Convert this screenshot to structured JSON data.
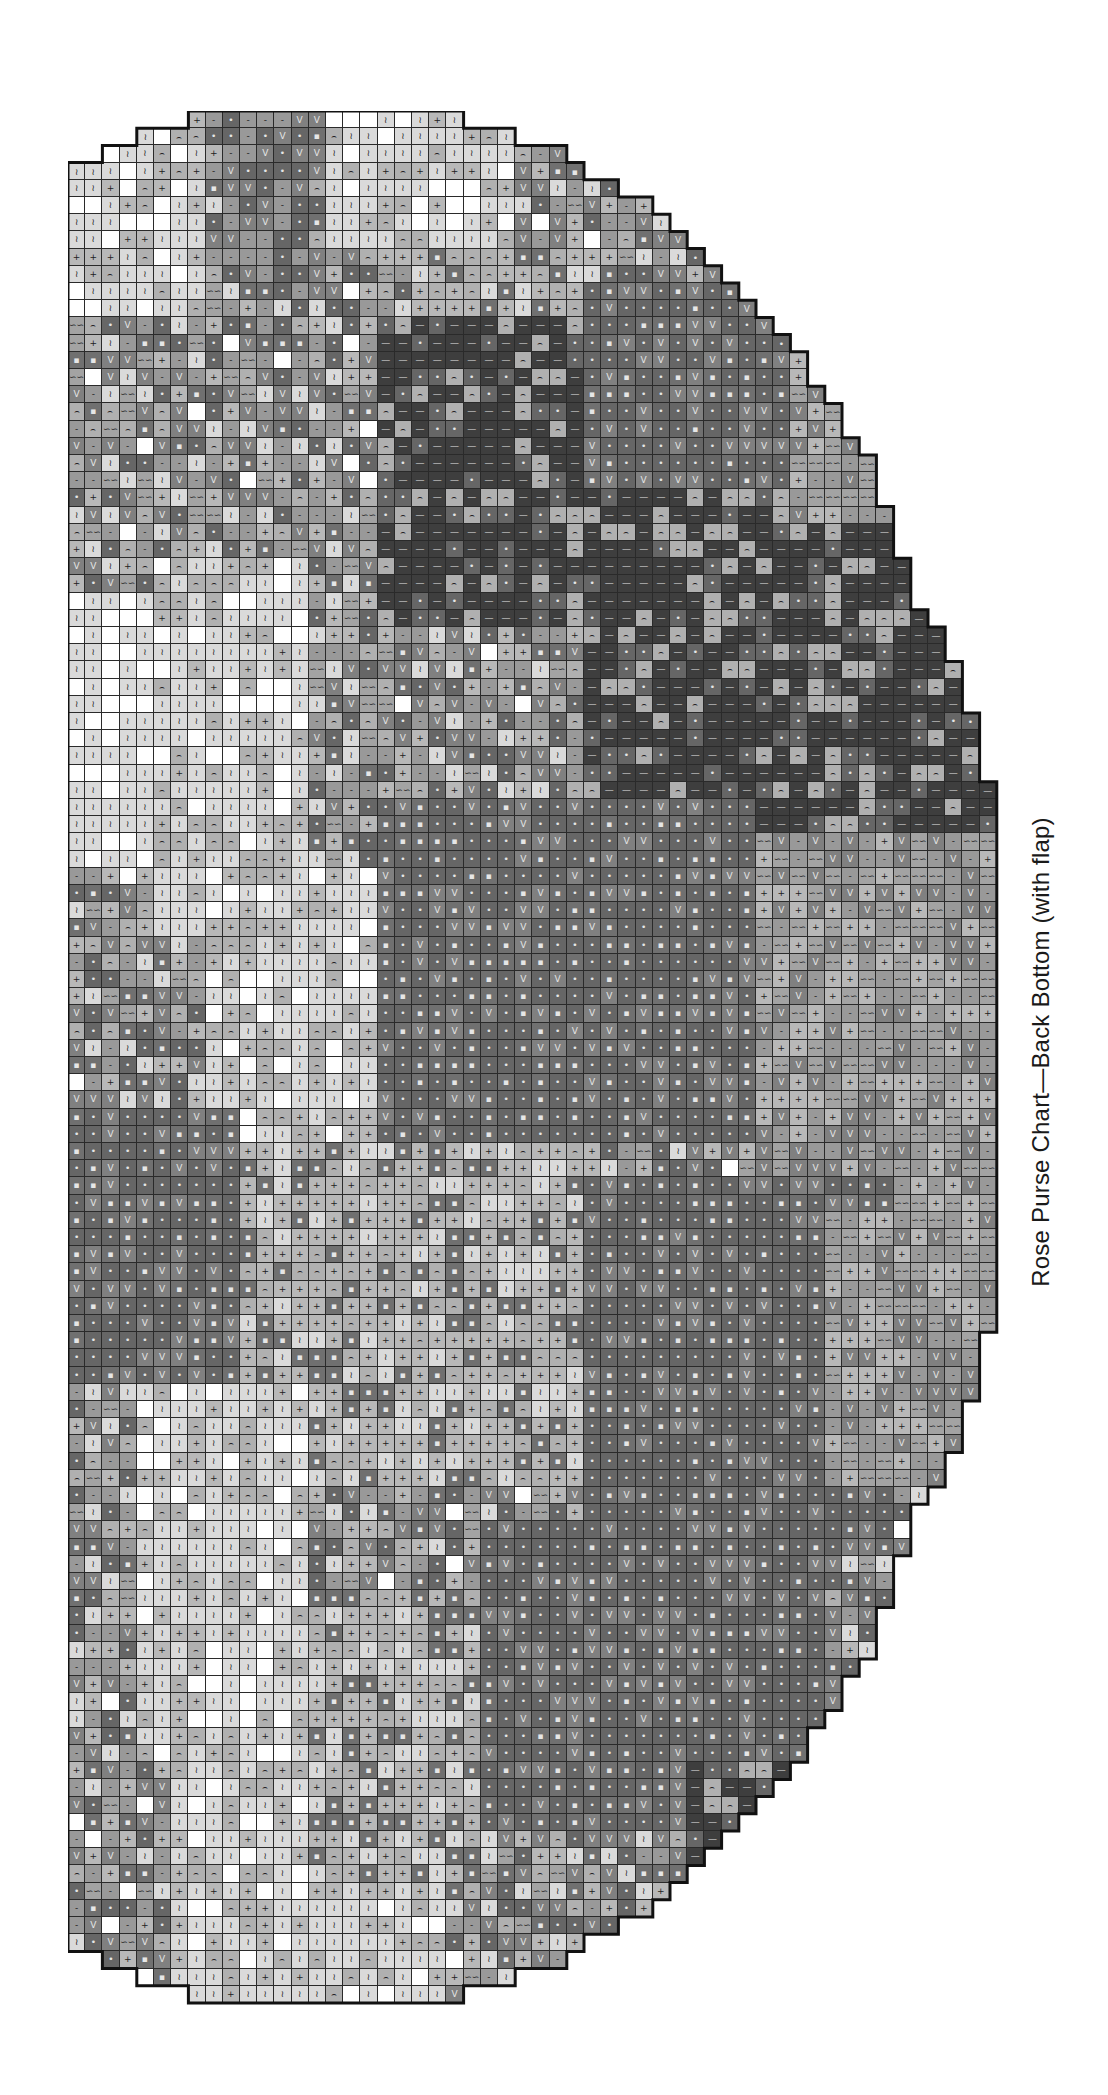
{
  "caption": "Rose Purse Chart—Back Bottom (with flap)",
  "chart_data": {
    "type": "heatmap",
    "title": "Rose Purse Chart—Back Bottom (with flap)",
    "grid": {
      "rows": 110,
      "cols": 55,
      "cell_px": 17.2,
      "left_px": 68,
      "top_px": 111
    },
    "legend": [
      {
        "key": "W",
        "symbol": "",
        "shade": "#ffffff",
        "name": "white"
      },
      {
        "key": "Z",
        "symbol": "≀",
        "shade": "#dadada",
        "name": "lightest"
      },
      {
        "key": "P",
        "symbol": "+",
        "shade": "#b8b8b8",
        "name": "light"
      },
      {
        "key": "A",
        "symbol": "⌢",
        "shade": "#b0b0b0",
        "name": "light-arc"
      },
      {
        "key": "S",
        "symbol": "∽∽",
        "shade": "#a3a3a3",
        "name": "medium-light"
      },
      {
        "key": "M",
        "symbol": "-",
        "shade": "#999999",
        "name": "medium"
      },
      {
        "key": "V",
        "symbol": "V",
        "shade": "#808080",
        "name": "medium-dark"
      },
      {
        "key": "D",
        "symbol": "•",
        "shade": "#666666",
        "name": "dark"
      },
      {
        "key": "Q",
        "symbol": "▪",
        "shade": "#707070",
        "name": "dark-square"
      },
      {
        "key": "L",
        "symbol": "—",
        "shade": "#3e3e3e",
        "name": "darkest"
      }
    ],
    "row_bounds_top_half": [
      [
        7,
        23
      ],
      [
        4,
        26
      ],
      [
        2,
        29
      ],
      [
        0,
        30
      ],
      [
        0,
        32
      ],
      [
        0,
        34
      ],
      [
        0,
        35
      ],
      [
        0,
        36
      ],
      [
        0,
        37
      ],
      [
        0,
        38
      ],
      [
        0,
        39
      ],
      [
        0,
        40
      ],
      [
        0,
        41
      ],
      [
        0,
        42
      ],
      [
        0,
        43
      ],
      [
        0,
        43
      ],
      [
        0,
        44
      ],
      [
        0,
        45
      ],
      [
        0,
        45
      ],
      [
        0,
        46
      ],
      [
        0,
        47
      ],
      [
        0,
        47
      ],
      [
        0,
        47
      ],
      [
        0,
        48
      ],
      [
        0,
        48
      ],
      [
        0,
        48
      ],
      [
        0,
        49
      ],
      [
        0,
        49
      ],
      [
        0,
        49
      ],
      [
        0,
        50
      ],
      [
        0,
        51
      ],
      [
        0,
        51
      ],
      [
        0,
        52
      ],
      [
        0,
        52
      ],
      [
        0,
        52
      ],
      [
        0,
        53
      ],
      [
        0,
        53
      ],
      [
        0,
        53
      ],
      [
        0,
        53
      ],
      [
        0,
        54
      ],
      [
        0,
        54
      ],
      [
        0,
        54
      ],
      [
        0,
        54
      ],
      [
        0,
        54
      ],
      [
        0,
        54
      ],
      [
        0,
        54
      ],
      [
        0,
        54
      ],
      [
        0,
        54
      ],
      [
        0,
        54
      ],
      [
        0,
        54
      ],
      [
        0,
        54
      ],
      [
        0,
        54
      ],
      [
        0,
        54
      ],
      [
        0,
        54
      ],
      [
        0,
        54
      ]
    ],
    "regions": [
      {
        "shade": "Z",
        "rows": [
          0,
          12
        ],
        "cols": [
          0,
          8
        ]
      },
      {
        "shade": "V",
        "rows": [
          0,
          10
        ],
        "cols": [
          9,
          14
        ]
      },
      {
        "shade": "Z",
        "rows": [
          0,
          8
        ],
        "cols": [
          15,
          26
        ]
      },
      {
        "shade": "P",
        "rows": [
          8,
          16
        ],
        "cols": [
          20,
          32
        ]
      },
      {
        "shade": "L",
        "rows": [
          12,
          30
        ],
        "cols": [
          18,
          44
        ]
      },
      {
        "shade": "D",
        "rows": [
          10,
          22
        ],
        "cols": [
          30,
          42
        ]
      },
      {
        "shade": "S",
        "rows": [
          14,
          34
        ],
        "cols": [
          42,
          54
        ]
      },
      {
        "shade": "L",
        "rows": [
          24,
          42
        ],
        "cols": [
          30,
          54
        ]
      },
      {
        "shade": "W",
        "rows": [
          28,
          44
        ],
        "cols": [
          0,
          5
        ]
      },
      {
        "shade": "Z",
        "rows": [
          26,
          48
        ],
        "cols": [
          5,
          14
        ]
      },
      {
        "shade": "D",
        "rows": [
          40,
          60
        ],
        "cols": [
          18,
          40
        ]
      },
      {
        "shade": "S",
        "rows": [
          42,
          66
        ],
        "cols": [
          40,
          54
        ]
      },
      {
        "shade": "Z",
        "rows": [
          44,
          60
        ],
        "cols": [
          8,
          18
        ]
      },
      {
        "shade": "D",
        "rows": [
          58,
          74
        ],
        "cols": [
          0,
          10
        ]
      },
      {
        "shade": "P",
        "rows": [
          60,
          80
        ],
        "cols": [
          10,
          30
        ]
      },
      {
        "shade": "D",
        "rows": [
          62,
          84
        ],
        "cols": [
          30,
          48
        ]
      },
      {
        "shade": "S",
        "rows": [
          64,
          80
        ],
        "cols": [
          44,
          54
        ]
      },
      {
        "shade": "Z",
        "rows": [
          74,
          96
        ],
        "cols": [
          4,
          14
        ]
      },
      {
        "shade": "D",
        "rows": [
          82,
          100
        ],
        "cols": [
          24,
          44
        ]
      },
      {
        "shade": "Z",
        "rows": [
          96,
          110
        ],
        "cols": [
          6,
          22
        ]
      },
      {
        "shade": "P",
        "rows": [
          86,
          104
        ],
        "cols": [
          14,
          24
        ]
      },
      {
        "shade": "L",
        "rows": [
          96,
          104
        ],
        "cols": [
          36,
          44
        ]
      }
    ],
    "symbols_present": [
      "≀",
      "+",
      "⌢",
      "∽∽",
      "-",
      "V",
      "•",
      "▪",
      "—"
    ],
    "xlabel": "",
    "ylabel": ""
  }
}
